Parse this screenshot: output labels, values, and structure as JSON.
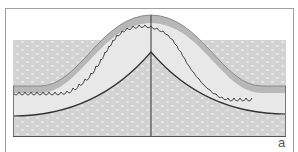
{
  "figure": {
    "label": "a",
    "type": "cross-section diagram",
    "layers": [
      {
        "name": "outer-band",
        "color": "#b5b5b5"
      },
      {
        "name": "upper-layer",
        "color": "#e6e6e6"
      },
      {
        "name": "lower-layer-textured",
        "color": "#d4d4d4"
      }
    ],
    "colors": {
      "frame": "#9a9a9a",
      "outline": "#3a3a3a",
      "background": "#ffffff"
    }
  }
}
